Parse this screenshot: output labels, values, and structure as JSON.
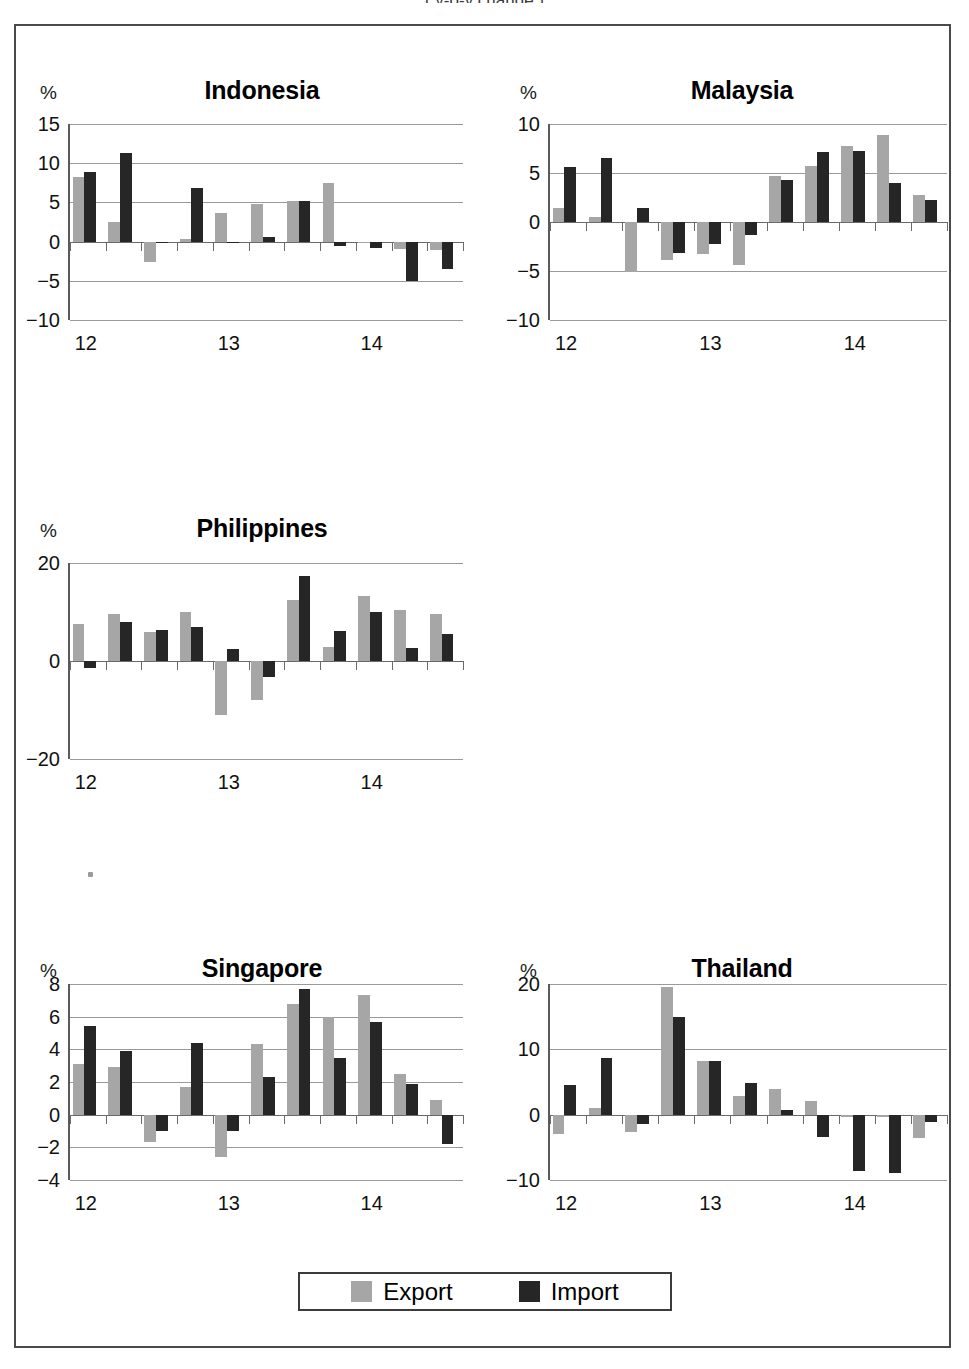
{
  "top_caption": "( y-o-y change )",
  "legend": {
    "export_label": "Export",
    "import_label": "Import",
    "export_color": "#a6a6a6",
    "import_color": "#262626"
  },
  "axis_unit": "%",
  "chart_data": [
    {
      "type": "bar",
      "title": "Indonesia",
      "ylabel": "%",
      "xlabel": "",
      "ylim": [
        -10,
        15
      ],
      "yticks": [
        15,
        10,
        5,
        0,
        -5,
        -10
      ],
      "ytick_labels": [
        "15",
        "10",
        "5",
        "0",
        "−5",
        "−10"
      ],
      "grid": true,
      "legend_position": "bottom-shared",
      "categories": [
        "12Q1",
        "12Q2",
        "12Q3",
        "12Q4",
        "13Q1",
        "13Q2",
        "13Q3",
        "13Q4",
        "14Q1",
        "14Q2",
        "14Q3"
      ],
      "xtick_labels": [
        "12",
        "13",
        "14"
      ],
      "xtick_positions": [
        0,
        4,
        8
      ],
      "series": [
        {
          "name": "Export",
          "values": [
            8.2,
            2.5,
            -2.6,
            0.3,
            3.6,
            4.8,
            5.2,
            7.5,
            -0.2,
            -1.0,
            -1.1
          ]
        },
        {
          "name": "Import",
          "values": [
            8.9,
            11.3,
            -0.2,
            6.8,
            -0.1,
            0.6,
            5.2,
            -0.5,
            -0.8,
            -5.0,
            -3.5
          ]
        }
      ]
    },
    {
      "type": "bar",
      "title": "Malaysia",
      "ylabel": "%",
      "xlabel": "",
      "ylim": [
        -10,
        10
      ],
      "yticks": [
        10,
        5,
        0,
        -5,
        -10
      ],
      "ytick_labels": [
        "10",
        "5",
        "0",
        "−5",
        "−10"
      ],
      "grid": true,
      "legend_position": "bottom-shared",
      "categories": [
        "12Q1",
        "12Q2",
        "12Q3",
        "12Q4",
        "13Q1",
        "13Q2",
        "13Q3",
        "13Q4",
        "14Q1",
        "14Q2",
        "14Q3"
      ],
      "xtick_labels": [
        "12",
        "13",
        "14"
      ],
      "xtick_positions": [
        0,
        4,
        8
      ],
      "series": [
        {
          "name": "Export",
          "values": [
            1.4,
            0.5,
            -5.1,
            -3.9,
            -3.3,
            -4.4,
            4.7,
            5.7,
            7.8,
            8.9,
            2.8
          ]
        },
        {
          "name": "Import",
          "values": [
            5.6,
            6.5,
            1.4,
            -3.2,
            -2.2,
            -1.3,
            4.3,
            7.1,
            7.2,
            4.0,
            2.2
          ]
        }
      ]
    },
    {
      "type": "bar",
      "title": "Philippines",
      "ylabel": "%",
      "xlabel": "",
      "ylim": [
        -20,
        20
      ],
      "yticks": [
        20,
        0,
        -20
      ],
      "ytick_labels": [
        "20",
        "0",
        "−20"
      ],
      "grid": true,
      "legend_position": "bottom-shared",
      "categories": [
        "12Q1",
        "12Q2",
        "12Q3",
        "12Q4",
        "13Q1",
        "13Q2",
        "13Q3",
        "13Q4",
        "14Q1",
        "14Q2",
        "14Q3"
      ],
      "xtick_labels": [
        "12",
        "13",
        "14"
      ],
      "xtick_positions": [
        0,
        4,
        8
      ],
      "series": [
        {
          "name": "Export",
          "values": [
            7.6,
            9.6,
            5.9,
            10.1,
            -11.0,
            -7.9,
            12.5,
            2.9,
            13.3,
            10.4,
            9.6
          ]
        },
        {
          "name": "Import",
          "values": [
            -1.5,
            8.0,
            6.3,
            7.0,
            2.5,
            -3.3,
            17.3,
            6.2,
            10.0,
            2.6,
            5.6
          ]
        }
      ]
    },
    {
      "type": "bar",
      "title": "Singapore",
      "ylabel": "%",
      "xlabel": "",
      "ylim": [
        -4,
        8
      ],
      "yticks": [
        8,
        6,
        4,
        2,
        0,
        -2,
        -4
      ],
      "ytick_labels": [
        "8",
        "6",
        "4",
        "2",
        "0",
        "−2",
        "−4"
      ],
      "grid": true,
      "legend_position": "bottom-shared",
      "categories": [
        "12Q1",
        "12Q2",
        "12Q3",
        "12Q4",
        "13Q1",
        "13Q2",
        "13Q3",
        "13Q4",
        "14Q1",
        "14Q2",
        "14Q3"
      ],
      "xtick_labels": [
        "12",
        "13",
        "14"
      ],
      "xtick_positions": [
        0,
        4,
        8
      ],
      "series": [
        {
          "name": "Export",
          "values": [
            3.1,
            2.9,
            -1.7,
            1.7,
            -2.6,
            4.3,
            6.8,
            6.0,
            7.3,
            2.5,
            0.9
          ]
        },
        {
          "name": "Import",
          "values": [
            5.4,
            3.9,
            -1.0,
            4.4,
            -1.0,
            2.3,
            7.7,
            3.5,
            5.7,
            1.9,
            -1.8
          ]
        }
      ]
    },
    {
      "type": "bar",
      "title": "Thailand",
      "ylabel": "%",
      "xlabel": "",
      "ylim": [
        -10,
        20
      ],
      "yticks": [
        20,
        10,
        0,
        -10
      ],
      "ytick_labels": [
        "20",
        "10",
        "0",
        "−10"
      ],
      "grid": true,
      "legend_position": "bottom-shared",
      "categories": [
        "12Q1",
        "12Q2",
        "12Q3",
        "12Q4",
        "13Q1",
        "13Q2",
        "13Q3",
        "13Q4",
        "14Q1",
        "14Q2",
        "14Q3"
      ],
      "xtick_labels": [
        "12",
        "13",
        "14"
      ],
      "xtick_positions": [
        0,
        4,
        8
      ],
      "series": [
        {
          "name": "Export",
          "values": [
            -3.0,
            1.0,
            -2.7,
            19.5,
            8.2,
            2.8,
            4.0,
            2.1,
            -0.3,
            -0.4,
            -3.6
          ]
        },
        {
          "name": "Import",
          "values": [
            4.5,
            8.6,
            -1.5,
            15.0,
            8.2,
            4.8,
            0.7,
            -3.4,
            -8.6,
            -8.9,
            -1.2
          ]
        }
      ]
    }
  ]
}
